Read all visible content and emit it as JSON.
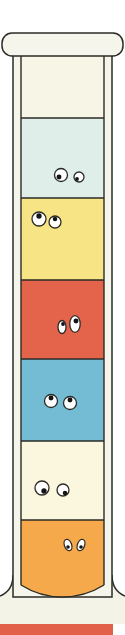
{
  "illustration": {
    "subject": "graduated cylinder with liquid layers",
    "colors": {
      "outline": "#2b2b26",
      "glass": "#f6f5ec",
      "empty_top": "#f7f6e6",
      "base": "#f4f3e8",
      "bottom_bar": "#e2604a"
    },
    "layers": [
      {
        "name": "light-cyan",
        "color": "#dfeee9",
        "top": 118,
        "bottom": 198,
        "eyes": {
          "left": [
            61,
            175,
            6.5
          ],
          "right": [
            79,
            177,
            5
          ],
          "pupil_dx": -2,
          "pupil_dy": 2
        }
      },
      {
        "name": "yellow",
        "color": "#f7e484",
        "top": 198,
        "bottom": 280,
        "eyes": {
          "left": [
            39,
            219,
            7
          ],
          "right": [
            55,
            222,
            6
          ],
          "pupil_dx": 0,
          "pupil_dy": -3
        }
      },
      {
        "name": "red",
        "color": "#e4634b",
        "top": 280,
        "bottom": 359,
        "eyes": {
          "left": [
            62,
            327,
            5
          ],
          "right": [
            75,
            324,
            6.5
          ],
          "pupil_dx": 1,
          "pupil_dy": -3
        }
      },
      {
        "name": "blue",
        "color": "#74bcd4",
        "top": 359,
        "bottom": 441,
        "eyes": {
          "left": [
            51,
            401,
            6.5
          ],
          "right": [
            70,
            403,
            6.5
          ],
          "pupil_dx": 0,
          "pupil_dy": -3
        }
      },
      {
        "name": "cream",
        "color": "#fbf6de",
        "top": 441,
        "bottom": 520,
        "eyes": {
          "left": [
            42,
            488,
            7
          ],
          "right": [
            63,
            490,
            6
          ],
          "pupil_dx": 2,
          "pupil_dy": 3
        }
      },
      {
        "name": "orange",
        "color": "#f6a94a",
        "top": 520,
        "bottom": 597,
        "eyes": {
          "left": [
            68,
            545,
            4.5
          ],
          "right": [
            81,
            545,
            4.5
          ],
          "pupil_dx": 0,
          "pupil_dy": 2
        }
      }
    ]
  }
}
